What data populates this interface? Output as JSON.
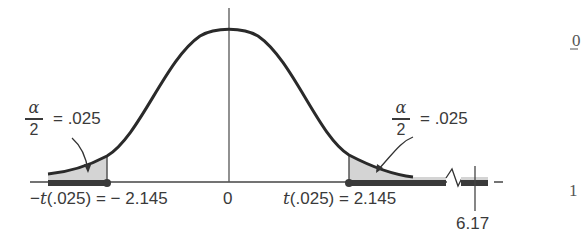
{
  "figure": {
    "left_tail": {
      "alpha_symbol": "α",
      "denominator": "2",
      "equals_value": "= .025",
      "critical_label_prefix": "−",
      "critical_label_t": "t",
      "critical_label_rest": "(.025) = − 2.145"
    },
    "right_tail": {
      "alpha_symbol": "α",
      "denominator": "2",
      "equals_value": "= .025",
      "critical_label_t": "t",
      "critical_label_rest": "(.025) = 2.145"
    },
    "center_label": "0",
    "observed_value_label": "6.17",
    "margin_text": {
      "top": "0",
      "bottom": "1"
    },
    "colors": {
      "curve": "#2a2a2a",
      "shade": "#d4d4d4",
      "rejection_bar": "#3a3a3a",
      "axis": "#444444"
    }
  }
}
